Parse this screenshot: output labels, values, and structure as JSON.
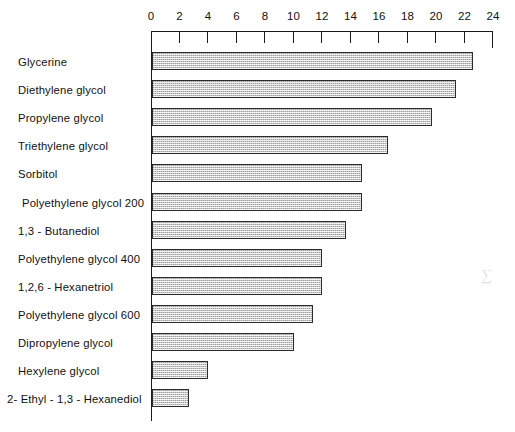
{
  "chart_data": {
    "type": "bar",
    "orientation": "horizontal",
    "title": "",
    "xlabel": "",
    "ylabel": "",
    "xlim": [
      0,
      24
    ],
    "xticks": [
      0,
      2,
      4,
      6,
      8,
      10,
      12,
      14,
      16,
      18,
      20,
      22,
      24
    ],
    "xtick_labels": [
      "0",
      "2",
      "4",
      "6",
      "8",
      "10",
      "12",
      "14",
      "16",
      "18",
      "20",
      "22",
      "24"
    ],
    "grid": false,
    "legend": null,
    "categories": [
      "Glycerine",
      "Diethylene glycol",
      "Propylene glycol",
      "Triethylene glycol",
      "Sorbitol",
      "Polyethylene glycol 200",
      "1,3 - Butanediol",
      "Polyethylene glycol 400",
      "1,2,6 - Hexanetriol",
      "Polyethylene glycol 600",
      "Dipropylene glycol",
      "Hexylene glycol",
      "2- Ethyl - 1,3 - Hexanediol"
    ],
    "values": [
      22.6,
      21.4,
      19.7,
      16.6,
      14.8,
      14.8,
      13.7,
      12.0,
      12.0,
      11.4,
      10.0,
      4.0,
      2.7
    ],
    "bar_fill_color": "#c9c9c9",
    "bar_edge_color": "#2b2b2b",
    "axis_color": "#1a1a1a"
  },
  "artifact": {
    "mark": "∑"
  }
}
